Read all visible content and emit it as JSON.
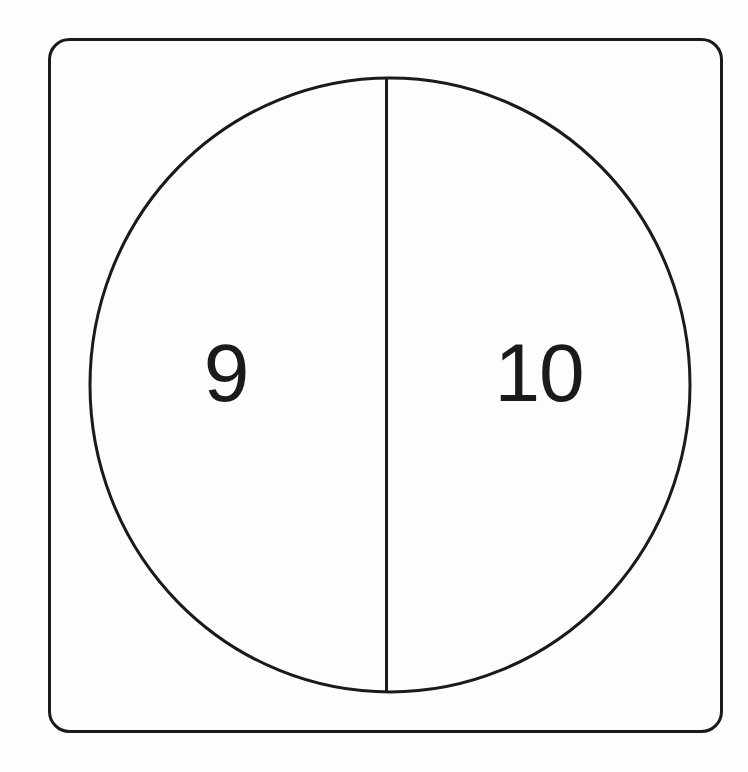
{
  "canvas": {
    "width": 748,
    "height": 772,
    "background_color": "#fdfdfd",
    "ink_color": "#1a1a1a"
  },
  "frame": {
    "shape": "rounded-rectangle",
    "x": 49.5,
    "y": 39.5,
    "width": 672,
    "height": 692,
    "corner_radius": 20,
    "stroke_width": 3,
    "stroke_color": "#1a1a1a",
    "fill": "none"
  },
  "figure": {
    "shape": "ellipse",
    "center_x": 390,
    "center_y": 385,
    "radius_x": 300,
    "radius_y": 307,
    "stroke_width": 3,
    "stroke_color": "#1a1a1a",
    "fill": "none"
  },
  "divider": {
    "orientation": "vertical",
    "x": 386.5,
    "y_start": 78,
    "y_end": 692,
    "stroke_width": 3,
    "stroke_color": "#1a1a1a"
  },
  "labels": [
    {
      "name": "left-region-label",
      "text": "9",
      "x": 226,
      "y": 379,
      "font_size": 82,
      "color": "#1a1a1a",
      "region": "left-half"
    },
    {
      "name": "right-region-label",
      "text": "10",
      "x": 539,
      "y": 379,
      "font_size": 82,
      "color": "#1a1a1a",
      "region": "right-half"
    }
  ],
  "chart_data": {
    "type": "pie",
    "title": "",
    "subtitle": "",
    "xlabel": "",
    "ylabel": "",
    "legend_position": "none",
    "grid": false,
    "annotations": [],
    "categories": [
      "9",
      "10"
    ],
    "values": [
      50,
      50
    ],
    "labels": [
      "9",
      "10"
    ],
    "slice_angles_deg": [
      180,
      180
    ]
  }
}
